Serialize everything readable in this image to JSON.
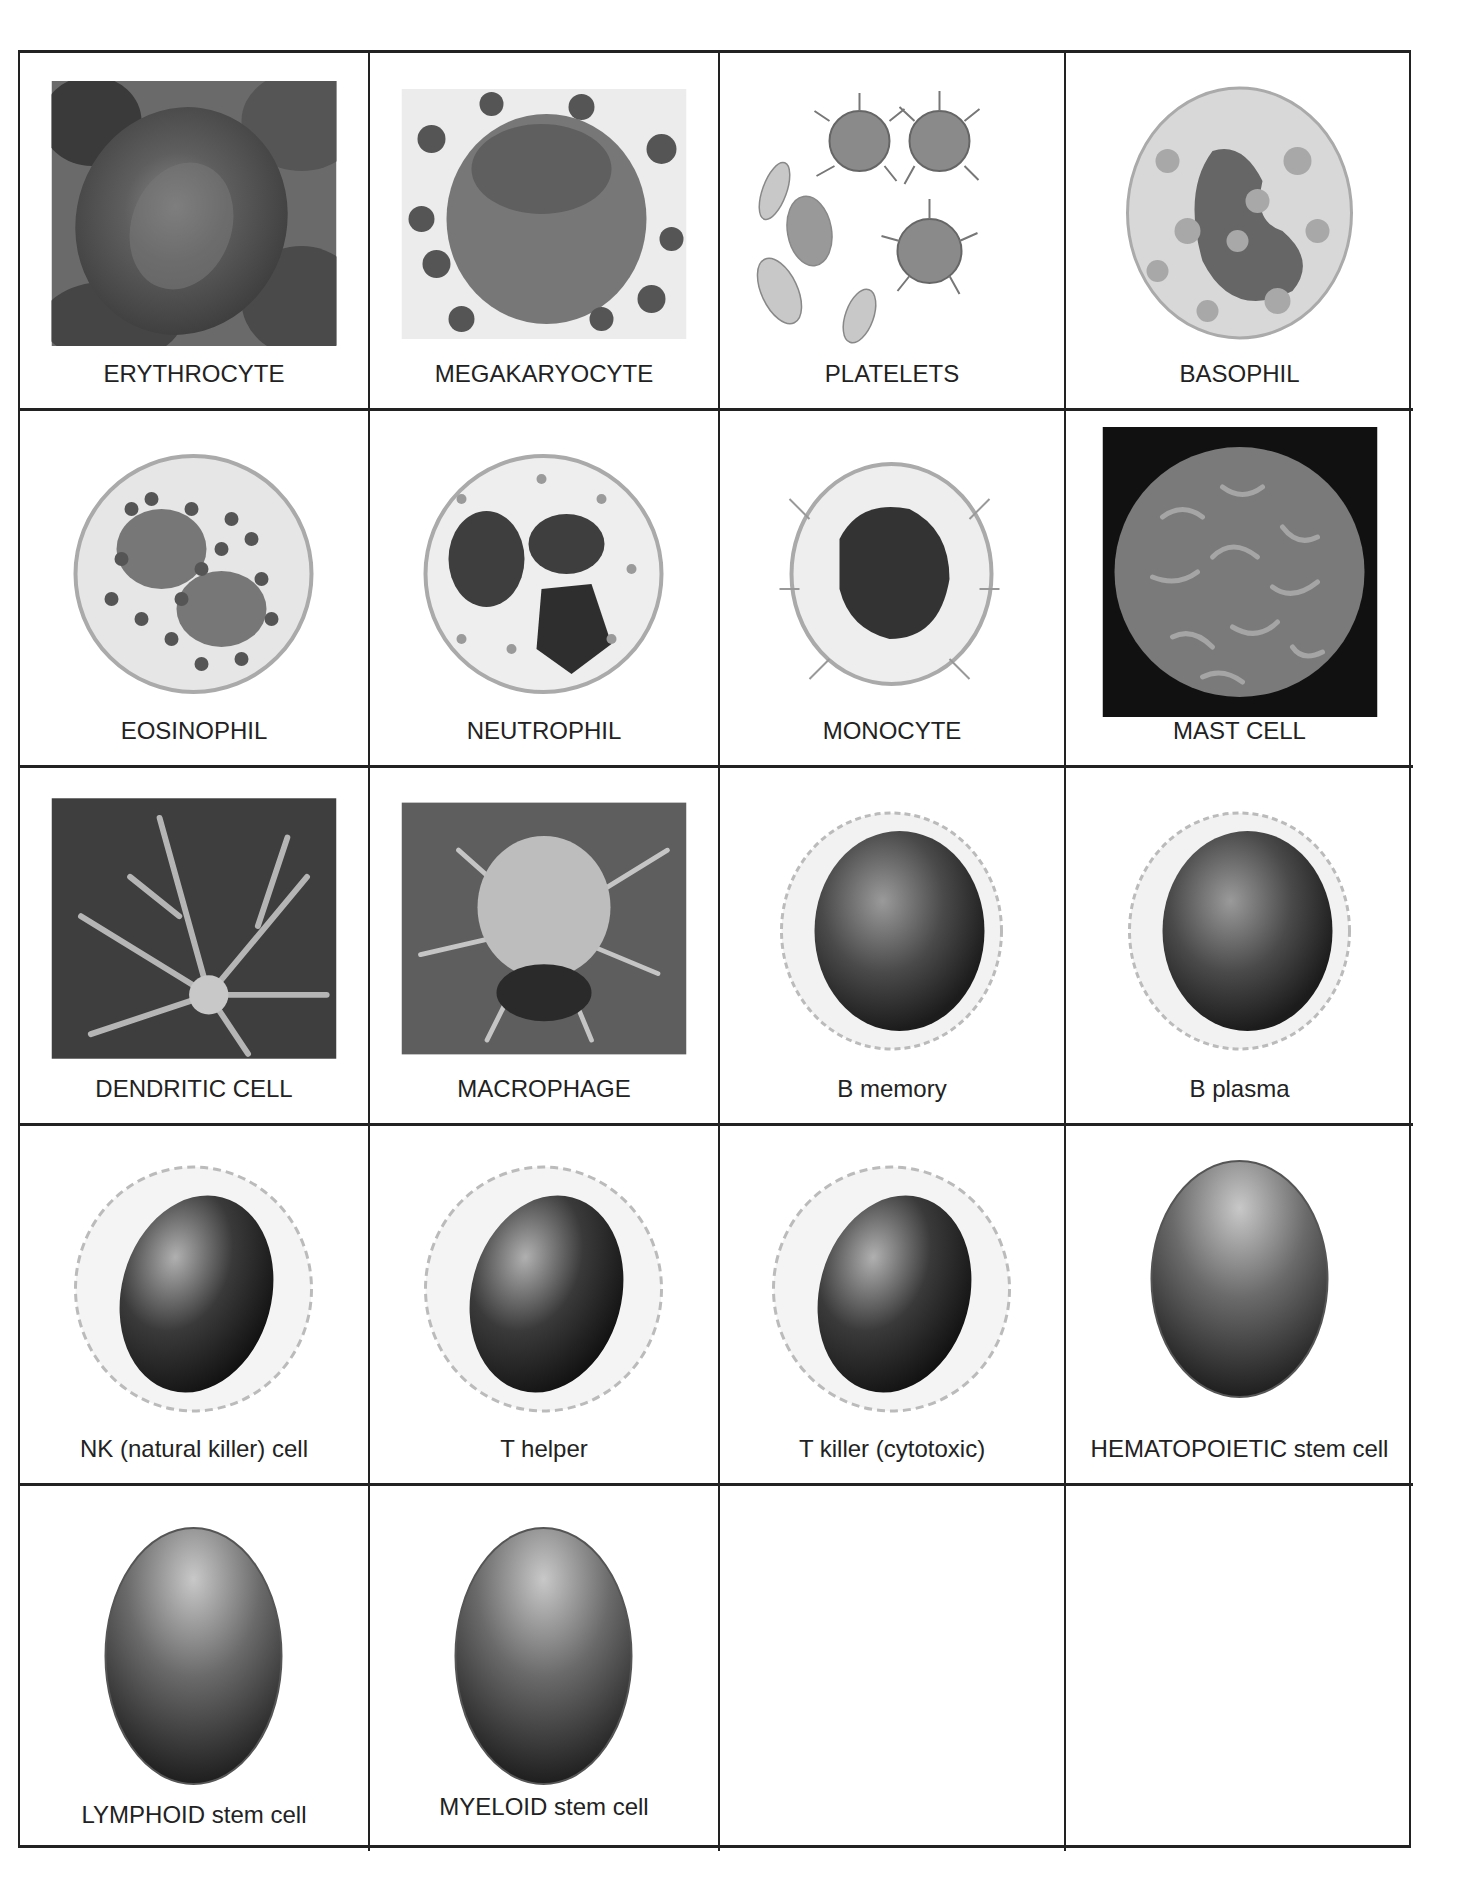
{
  "worksheet": {
    "cells": [
      {
        "label": "ERYTHROCYTE",
        "icon": "erythrocyte-image"
      },
      {
        "label": "MEGAKARYOCYTE",
        "icon": "megakaryocyte-image"
      },
      {
        "label": "PLATELETS",
        "icon": "platelets-image"
      },
      {
        "label": "BASOPHIL",
        "icon": "basophil-image"
      },
      {
        "label": "EOSINOPHIL",
        "icon": "eosinophil-image"
      },
      {
        "label": "NEUTROPHIL",
        "icon": "neutrophil-image"
      },
      {
        "label": "MONOCYTE",
        "icon": "monocyte-image"
      },
      {
        "label": "MAST CELL",
        "icon": "mast-cell-image"
      },
      {
        "label": "DENDRITIC CELL",
        "icon": "dendritic-cell-image"
      },
      {
        "label": "MACROPHAGE",
        "icon": "macrophage-image"
      },
      {
        "label": "B memory",
        "icon": "b-memory-image"
      },
      {
        "label": "B plasma",
        "icon": "b-plasma-image"
      },
      {
        "label": "NK (natural killer) cell",
        "icon": "nk-cell-image"
      },
      {
        "label": "T helper",
        "icon": "t-helper-image"
      },
      {
        "label": "T killer (cytotoxic)",
        "icon": "t-killer-image"
      },
      {
        "label": "HEMATOPOIETIC stem cell",
        "icon": "hematopoietic-stem-cell-image"
      },
      {
        "label": "LYMPHOID stem cell",
        "icon": "lymphoid-stem-cell-image"
      },
      {
        "label": "MYELOID stem cell",
        "icon": "myeloid-stem-cell-image"
      },
      {
        "label": "",
        "icon": ""
      },
      {
        "label": "",
        "icon": ""
      }
    ]
  }
}
